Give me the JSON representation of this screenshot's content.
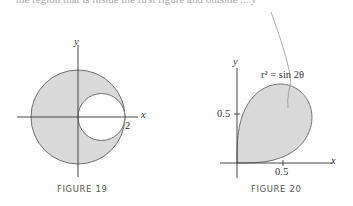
{
  "header_text_cut": "the region that is inside the first figure and outside ... y",
  "figures": [
    {
      "caption": "FIGURE 19",
      "x_label": "x",
      "y_label": "y",
      "tick_label": "2",
      "description": "Shaded region inside large circle of radius 2 centered at origin and outside small circle of radius 1 centered at (1,0)"
    },
    {
      "caption": "FIGURE 20",
      "x_label": "x",
      "y_label": "y",
      "x_tick": "0.5",
      "y_tick": "0.5",
      "curve_label": "r² = sin 2θ",
      "description": "Shaded loop of lemniscate r^2 = sin 2θ in first quadrant"
    }
  ],
  "colors": {
    "fill": "#d9d9d9",
    "stroke": "#707070",
    "axis": "#333333"
  }
}
